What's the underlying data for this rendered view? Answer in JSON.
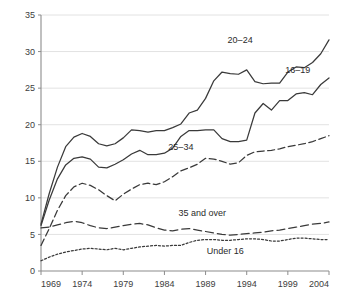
{
  "chart_data": {
    "type": "line",
    "title": "",
    "subtitle": "",
    "xlabel": "",
    "ylabel": "",
    "xlim": [
      1969,
      2004
    ],
    "ylim": [
      0,
      35
    ],
    "grid": true,
    "legend_position": "inline-annotations",
    "y_ticks": [
      "0",
      "5",
      "10",
      "15",
      "20",
      "25",
      "30",
      "35"
    ],
    "y_tick_values": [
      0,
      5,
      10,
      15,
      20,
      25,
      30,
      35
    ],
    "x_ticks": [
      "1969",
      "1974",
      "1979",
      "1984",
      "1989",
      "1994",
      "1999",
      "2004"
    ],
    "x_tick_values": [
      1969,
      1974,
      1979,
      1984,
      1989,
      1994,
      1999,
      2004
    ],
    "x": [
      1969,
      1970,
      1971,
      1972,
      1973,
      1974,
      1975,
      1976,
      1977,
      1978,
      1979,
      1980,
      1981,
      1982,
      1983,
      1984,
      1985,
      1986,
      1987,
      1988,
      1989,
      1990,
      1991,
      1992,
      1993,
      1994,
      1995,
      1996,
      1997,
      1998,
      1999,
      2000,
      2001,
      2002,
      2003,
      2004
    ],
    "series": [
      {
        "name": "20-24",
        "label": "20–24",
        "style": "solid",
        "label_x": 1993.2,
        "label_y": 31.2,
        "values": [
          6.4,
          10.6,
          14.2,
          17.0,
          18.3,
          18.8,
          18.4,
          17.4,
          17.1,
          17.4,
          18.2,
          19.3,
          19.2,
          19.0,
          19.2,
          19.2,
          19.6,
          20.1,
          21.6,
          22.0,
          23.6,
          26.0,
          27.2,
          27.0,
          26.9,
          27.5,
          25.9,
          25.6,
          25.7,
          25.7,
          27.2,
          27.9,
          27.8,
          28.5,
          29.7,
          31.6
        ]
      },
      {
        "name": "16-19",
        "label": "16–19",
        "style": "solid",
        "label_x": 2000.2,
        "label_y": 27.1,
        "values": [
          6.2,
          9.7,
          12.6,
          14.5,
          15.4,
          15.6,
          15.3,
          14.2,
          14.1,
          14.6,
          15.2,
          16.0,
          16.5,
          15.9,
          15.9,
          16.1,
          16.8,
          18.4,
          19.2,
          19.2,
          19.3,
          19.3,
          18.1,
          17.7,
          17.7,
          17.9,
          21.6,
          22.9,
          22.0,
          23.3,
          23.3,
          24.2,
          24.4,
          24.1,
          25.5,
          26.4
        ]
      },
      {
        "name": "25-34",
        "label": "25–34",
        "style": "dashed",
        "label_x": 1986.0,
        "label_y": 16.5,
        "values": [
          3.5,
          5.8,
          8.3,
          10.3,
          11.5,
          12.0,
          11.7,
          11.1,
          10.3,
          9.6,
          10.5,
          11.2,
          11.8,
          12.0,
          11.8,
          12.2,
          12.9,
          13.7,
          14.1,
          14.6,
          15.4,
          15.3,
          15.0,
          14.6,
          14.8,
          15.8,
          16.3,
          16.4,
          16.5,
          16.7,
          17.0,
          17.2,
          17.4,
          17.7,
          18.1,
          18.5
        ]
      },
      {
        "name": "35 and over",
        "label": "35 and over",
        "style": "long-dash",
        "label_x": 1988.6,
        "label_y": 7.5,
        "values": [
          5.9,
          6.0,
          6.3,
          6.6,
          6.8,
          6.6,
          6.2,
          5.9,
          5.8,
          6.0,
          6.2,
          6.4,
          6.5,
          6.3,
          5.9,
          5.6,
          5.5,
          5.7,
          5.8,
          5.6,
          5.4,
          5.2,
          5.0,
          4.9,
          5.0,
          5.1,
          5.2,
          5.3,
          5.5,
          5.6,
          5.8,
          6.0,
          6.2,
          6.4,
          6.5,
          6.7
        ]
      },
      {
        "name": "Under 16",
        "label": "Under 16",
        "style": "dotted",
        "label_x": 1991.4,
        "label_y": 2.3,
        "values": [
          1.4,
          1.9,
          2.3,
          2.6,
          2.8,
          3.0,
          3.1,
          3.0,
          2.9,
          3.1,
          2.9,
          3.1,
          3.3,
          3.4,
          3.5,
          3.4,
          3.5,
          3.5,
          3.9,
          4.2,
          4.3,
          4.3,
          4.2,
          4.2,
          4.3,
          4.4,
          4.4,
          4.3,
          4.1,
          4.1,
          4.3,
          4.5,
          4.5,
          4.4,
          4.3,
          4.3
        ]
      }
    ]
  }
}
